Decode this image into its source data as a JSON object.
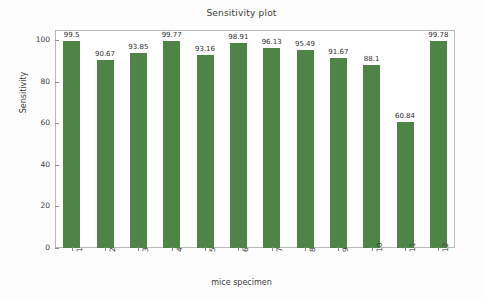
{
  "chart_data": {
    "type": "bar",
    "title": "Sensitivity plot",
    "xlabel": "mice specimen",
    "ylabel": "Sensitivity",
    "categories": [
      "1",
      "2",
      "3",
      "4",
      "5",
      "6",
      "7",
      "8",
      "9",
      "10",
      "11",
      "12"
    ],
    "values": [
      99.5,
      90.67,
      93.85,
      99.77,
      93.16,
      98.91,
      96.13,
      95.49,
      91.67,
      88.1,
      60.84,
      99.78
    ],
    "value_labels": [
      "99.5",
      "90.67",
      "93.85",
      "99.77",
      "93.16",
      "98.91",
      "96.13",
      "95.49",
      "91.67",
      "88.1",
      "60.84",
      "99.78"
    ],
    "ylim": [
      0,
      105
    ],
    "yticks": [
      0,
      20,
      40,
      60,
      80,
      100
    ],
    "ytick_labels": [
      "0",
      "20",
      "40",
      "60",
      "80",
      "100"
    ],
    "grid": false,
    "legend": null,
    "bar_color": "#4e8546",
    "frame_color": "#b9b9b9",
    "background": "#fdfdfd"
  }
}
